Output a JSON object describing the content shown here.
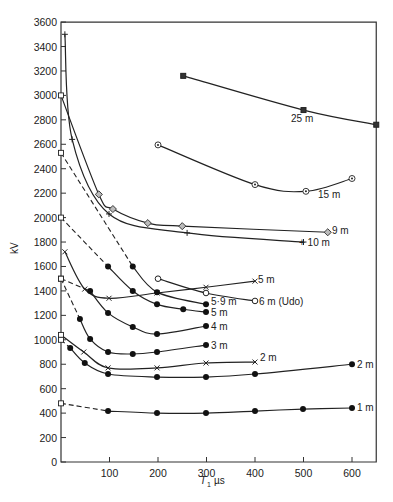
{
  "chart_data": {
    "type": "line",
    "title": "",
    "xlabel": "T1 µs",
    "ylabel": "kV",
    "xlim": [
      0,
      650
    ],
    "ylim": [
      0,
      3600
    ],
    "xticks": [
      100,
      200,
      300,
      400,
      500,
      600
    ],
    "yticks": [
      0,
      200,
      400,
      600,
      800,
      1000,
      1200,
      1400,
      1600,
      1800,
      2000,
      2200,
      2400,
      2600,
      2800,
      3000,
      3200,
      3400,
      3600
    ],
    "grid": false,
    "legend": "inline labels at curve ends",
    "series": [
      {
        "name": "25 m",
        "marker": "filled-square",
        "points": [
          [
            252,
            3160
          ],
          [
            500,
            2880
          ],
          [
            650,
            2760
          ]
        ]
      },
      {
        "name": "15 m",
        "marker": "circled-dot",
        "points": [
          [
            200,
            2595
          ],
          [
            400,
            2270
          ],
          [
            505,
            2215
          ],
          [
            600,
            2320
          ]
        ]
      },
      {
        "name": "9 m",
        "marker": "diamond",
        "points": [
          [
            0,
            3000
          ],
          [
            78,
            2190
          ],
          [
            107,
            2070
          ],
          [
            179,
            1955
          ],
          [
            250,
            1930
          ],
          [
            550,
            1880
          ]
        ]
      },
      {
        "name": "10 m",
        "marker": "plus",
        "points": [
          [
            8,
            3500
          ],
          [
            23,
            2640
          ],
          [
            99,
            2030
          ],
          [
            260,
            1875
          ],
          [
            500,
            1800
          ]
        ]
      },
      {
        "name": "5 m (x)",
        "marker": "x",
        "points": [
          [
            8,
            1720
          ],
          [
            49,
            1415
          ],
          [
            99,
            1340
          ],
          [
            198,
            1383
          ],
          [
            299,
            1430
          ],
          [
            400,
            1480
          ]
        ]
      },
      {
        "name": "6 m (Udo)",
        "marker": "open-circle",
        "points": [
          [
            200,
            1500
          ],
          [
            299,
            1383
          ],
          [
            400,
            1318
          ]
        ]
      },
      {
        "name": "5.9 m",
        "marker": "filled-circle",
        "points": [
          [
            0,
            2530
          ],
          [
            148,
            1600
          ],
          [
            198,
            1390
          ],
          [
            299,
            1290
          ]
        ]
      },
      {
        "name": "5 m",
        "marker": "filled-circle",
        "points": [
          [
            0,
            2000
          ],
          [
            97,
            1600
          ],
          [
            148,
            1400
          ],
          [
            198,
            1290
          ],
          [
            252,
            1250
          ],
          [
            299,
            1227
          ]
        ]
      },
      {
        "name": "4 m",
        "marker": "filled-circle",
        "points": [
          [
            0,
            1500
          ],
          [
            60,
            1400
          ],
          [
            97,
            1220
          ],
          [
            148,
            1105
          ],
          [
            198,
            1047
          ],
          [
            299,
            1113
          ]
        ]
      },
      {
        "name": "3 m",
        "marker": "filled-circle",
        "points": [
          [
            0,
            1500
          ],
          [
            39,
            1170
          ],
          [
            60,
            1007
          ],
          [
            97,
            900
          ],
          [
            148,
            884
          ],
          [
            198,
            900
          ],
          [
            299,
            957
          ]
        ]
      },
      {
        "name": "2 m (x)",
        "marker": "x",
        "points": [
          [
            0,
            1040
          ],
          [
            47,
            900
          ],
          [
            97,
            770
          ],
          [
            198,
            770
          ],
          [
            299,
            810
          ],
          [
            400,
            818
          ]
        ]
      },
      {
        "name": "2 m",
        "marker": "filled-circle",
        "points": [
          [
            0,
            1000
          ],
          [
            19,
            933
          ],
          [
            49,
            810
          ],
          [
            97,
            720
          ],
          [
            198,
            695
          ],
          [
            299,
            695
          ],
          [
            400,
            720
          ],
          [
            600,
            800
          ]
        ]
      },
      {
        "name": "1 m",
        "marker": "filled-circle",
        "points": [
          [
            0,
            480
          ],
          [
            97,
            417
          ],
          [
            198,
            400
          ],
          [
            299,
            400
          ],
          [
            400,
            417
          ],
          [
            499,
            433
          ],
          [
            600,
            442
          ]
        ]
      }
    ],
    "dashed_segments_note": "Curves originating at x=0 squares (3000, 2530, 2000, 1500, 1000) run dashed down to the first filled marker"
  },
  "labels": {
    "ylabel": "kV",
    "xlabel_main": "T",
    "xlabel_sub": "1",
    "xlabel_unit": "µs",
    "c25": "25 m",
    "c15": "15 m",
    "c9": "9 m",
    "c10": "+ 10 m",
    "c5x": "5 m",
    "c6": "6 m (Udo)",
    "c59": "5·9 m",
    "c5": "5 m",
    "c4": "4 m",
    "c3": "3 m",
    "c2x": "2 m",
    "c2": "2 m",
    "c1": "1 m"
  }
}
